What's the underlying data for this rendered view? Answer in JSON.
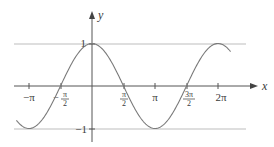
{
  "chart_data": {
    "type": "line",
    "title": "",
    "function": "y = cos(x)",
    "xlabel": "x",
    "ylabel": "y",
    "x_ticks": [
      {
        "value": -3.14159,
        "label": "−π"
      },
      {
        "value": -1.5708,
        "label": "−π/2"
      },
      {
        "value": 1.5708,
        "label": "π/2"
      },
      {
        "value": 3.14159,
        "label": "π"
      },
      {
        "value": 4.71239,
        "label": "3π/2"
      },
      {
        "value": 6.28319,
        "label": "2π"
      }
    ],
    "y_ticks": [
      {
        "value": 1,
        "label": "1"
      },
      {
        "value": -1,
        "label": "−1"
      }
    ],
    "reference_lines": [
      {
        "y": 1,
        "label": "y = 1"
      },
      {
        "y": -1,
        "label": "y = −1"
      }
    ],
    "xlim": [
      -3.77,
      6.91
    ],
    "ylim": [
      -1,
      1
    ],
    "x_range_plotted": [
      -3.77,
      6.91
    ],
    "grid": false,
    "legend": null,
    "series": [
      {
        "name": "cos x",
        "x": [
          -3.77,
          -3.14159,
          -2.35619,
          -1.5708,
          -0.7854,
          0,
          0.7854,
          1.5708,
          2.35619,
          3.14159,
          3.92699,
          4.71239,
          5.49779,
          6.28319,
          6.91
        ],
        "values": [
          -0.81,
          -1,
          -0.707,
          0,
          0.707,
          1,
          0.707,
          0,
          -0.707,
          -1,
          -0.707,
          0,
          0.707,
          1,
          0.81
        ]
      }
    ]
  },
  "labels": {
    "x_axis": "x",
    "y_axis": "y",
    "neg_pi": "−π",
    "neg_half_pi_num": "π",
    "neg_half_pi_den": "2",
    "neg_sign": "−",
    "half_pi_num": "π",
    "half_pi_den": "2",
    "pi": "π",
    "three_half_pi_num": "3π",
    "three_half_pi_den": "2",
    "two_pi": "2π",
    "y_one": "1",
    "y_neg_one": "−1"
  },
  "colors": {
    "curve": "#7a7a7a",
    "axes": "#555555",
    "reference_lines": "#bdbdbd"
  }
}
